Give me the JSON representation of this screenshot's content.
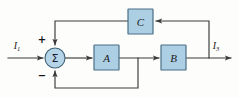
{
  "diagram": {
    "colors": {
      "block_fill": "#accfe4",
      "block_stroke": "#4a6f86",
      "sum_fill": "#b6d4e8",
      "sum_stroke": "#3f6276",
      "wire": "#3a3a3a",
      "background": "#fdfdfb"
    },
    "blocks": [
      {
        "id": "A",
        "label": "A",
        "x": 94,
        "y": 45,
        "w": 25,
        "h": 25
      },
      {
        "id": "B",
        "label": "B",
        "x": 161,
        "y": 45,
        "w": 25,
        "h": 25
      },
      {
        "id": "C",
        "label": "C",
        "x": 128,
        "y": 9,
        "w": 25,
        "h": 25
      }
    ],
    "summing_junction": {
      "glyph": "Σ",
      "cx": 55,
      "cy": 58,
      "r": 10,
      "plus_sign": "+",
      "minus_sign": "−"
    },
    "signals": {
      "input": {
        "name": "I",
        "subscript": "1"
      },
      "output": {
        "name": "I",
        "subscript": "3"
      }
    },
    "paths": [
      {
        "id": "input-to-sum",
        "from": "I1",
        "to": "summing-junction"
      },
      {
        "id": "sum-to-A",
        "from": "summing-junction",
        "to": "A"
      },
      {
        "id": "A-to-B",
        "from": "A",
        "to": "B"
      },
      {
        "id": "B-to-output",
        "from": "B",
        "to": "I3"
      },
      {
        "id": "output-to-C",
        "from": "output-node",
        "to": "C"
      },
      {
        "id": "C-to-sum-plus",
        "from": "C",
        "to": "summing-junction-plus"
      },
      {
        "id": "A-to-sum-minus",
        "from": "A-output-node",
        "to": "summing-junction-minus"
      }
    ]
  }
}
